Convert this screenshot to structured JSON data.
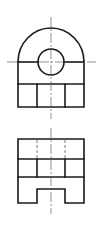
{
  "diagram": {
    "type": "orthographic-projection",
    "views": [
      {
        "name": "top-view",
        "features": [
          "semicircular-top",
          "through-hole",
          "three-slot-base"
        ]
      },
      {
        "name": "front-view",
        "features": [
          "three-bay-block",
          "hidden-edges",
          "bottom-notch"
        ]
      }
    ],
    "colors": {
      "line": "#1a1a1a",
      "centerline": "#444444",
      "hidden": "#555555",
      "background": "#ffffff"
    }
  }
}
